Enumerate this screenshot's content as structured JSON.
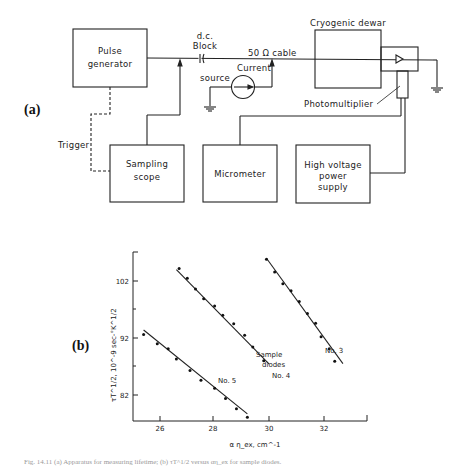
{
  "panel_a": {
    "label": "(a)",
    "blocks": {
      "pulse_generator": [
        "Pulse",
        "generator"
      ],
      "sampling_scope": [
        "Sampling",
        "scope"
      ],
      "micrometer": [
        "Micrometer"
      ],
      "hv_supply": [
        "High voltage",
        "power",
        "supply"
      ],
      "cryogenic_dewar": "Cryogenic dewar"
    },
    "labels": {
      "dc_block": [
        "d.c.",
        "Block"
      ],
      "cable": "50 Ω cable",
      "current_source": [
        "Current",
        "source"
      ],
      "photomultiplier": "Photomultiplier",
      "trigger": "Trigger"
    }
  },
  "panel_b": {
    "label": "(b)",
    "ylabel": "τT^1/2,  10^-9 sec-°K^1/2",
    "xlabel": "α η_ex, cm^-1",
    "annotations": {
      "sample_diodes": [
        "Sample",
        "diodes"
      ],
      "no3": "No. 3",
      "no4": "No. 4",
      "no5": "No. 5"
    }
  },
  "caption": "Fig. 14.11 (a) Apparatus for measuring lifetime; (b) τT^1/2 versus αη_ex for sample diodes.",
  "chart_data": {
    "type": "scatter",
    "title": "",
    "xlabel": "α η_ex, cm^-1",
    "ylabel": "τT^1/2, 10^-9 sec-°K^1/2",
    "x_ticks": [
      26,
      28,
      30,
      32
    ],
    "y_ticks": [
      82,
      92,
      102
    ],
    "xlim": [
      25.0,
      33.5
    ],
    "ylim": [
      77,
      107
    ],
    "grid": false,
    "legend": "inline labels",
    "series": [
      {
        "name": "No. 5",
        "x": [
          25.4,
          25.9,
          26.3,
          26.6,
          27.1,
          27.5,
          28.0,
          28.4,
          28.8,
          29.2
        ],
        "y": [
          92.6,
          91.0,
          90.1,
          88.3,
          86.3,
          84.6,
          83.2,
          81.4,
          79.6,
          78.1
        ],
        "fit": {
          "x": [
            25.4,
            29.2
          ],
          "y": [
            93.4,
            78.7
          ]
        }
      },
      {
        "name": "No. 4",
        "x": [
          26.7,
          27.0,
          27.3,
          27.6,
          28.0,
          28.3,
          28.7,
          29.1,
          29.4,
          29.8
        ],
        "y": [
          104.2,
          102.5,
          100.6,
          98.9,
          97.6,
          96.0,
          94.5,
          92.5,
          90.4,
          88.0
        ],
        "fit": {
          "x": [
            26.6,
            30.0
          ],
          "y": [
            104.0,
            87.4
          ]
        }
      },
      {
        "name": "No. 3",
        "x": [
          29.9,
          30.2,
          30.5,
          30.8,
          31.1,
          31.4,
          31.7,
          31.9,
          32.2,
          32.4
        ],
        "y": [
          105.8,
          103.6,
          101.5,
          100.3,
          98.4,
          96.3,
          94.6,
          92.2,
          90.1,
          87.9
        ],
        "fit": {
          "x": [
            29.9,
            32.7
          ],
          "y": [
            106.0,
            87.5
          ]
        }
      }
    ]
  }
}
